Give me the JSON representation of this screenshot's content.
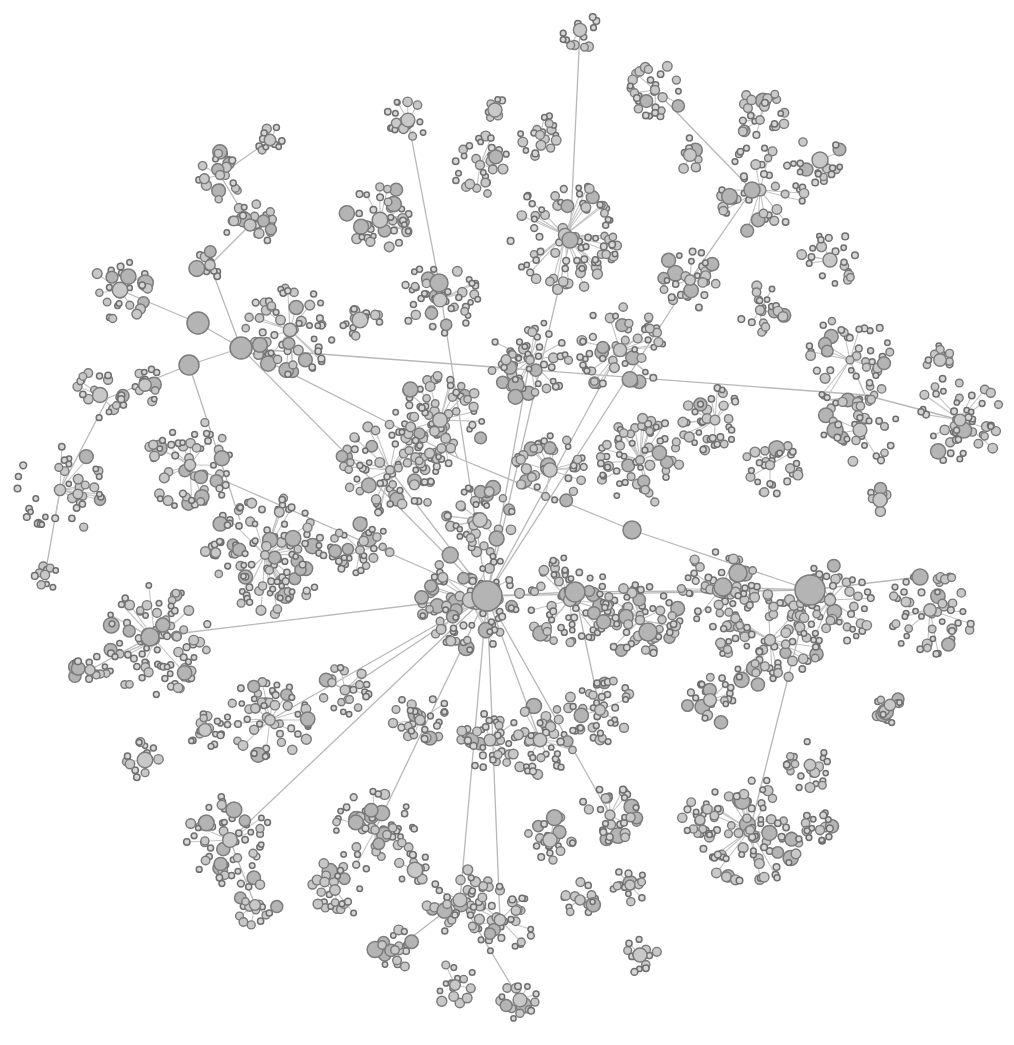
{
  "diagram": {
    "type": "force-directed network graph",
    "colors": {
      "background": "#ffffff",
      "node_fill": "#c8c8c8",
      "node_stroke": "#7a7a7a",
      "edge": "#c4c4c4"
    },
    "hubs": [
      {
        "id": "central",
        "x": 487,
        "y": 596,
        "r": 15
      },
      {
        "id": "east",
        "x": 810,
        "y": 590,
        "r": 15
      },
      {
        "id": "nw1",
        "x": 241,
        "y": 348,
        "r": 11
      },
      {
        "id": "nw2",
        "x": 198,
        "y": 323,
        "r": 11
      },
      {
        "id": "nw3",
        "x": 189,
        "y": 365,
        "r": 10
      },
      {
        "id": "n1",
        "x": 439,
        "y": 283,
        "r": 9
      },
      {
        "id": "n2",
        "x": 570,
        "y": 240,
        "r": 8
      },
      {
        "id": "ne1",
        "x": 752,
        "y": 190,
        "r": 8
      },
      {
        "id": "e1",
        "x": 575,
        "y": 592,
        "r": 10
      },
      {
        "id": "e2",
        "x": 632,
        "y": 530,
        "r": 9
      },
      {
        "id": "e3",
        "x": 648,
        "y": 632,
        "r": 9
      },
      {
        "id": "e4",
        "x": 723,
        "y": 587,
        "r": 9
      },
      {
        "id": "e5",
        "x": 738,
        "y": 573,
        "r": 9
      },
      {
        "id": "w1",
        "x": 150,
        "y": 637,
        "r": 9
      },
      {
        "id": "far-e",
        "x": 920,
        "y": 577,
        "r": 8
      }
    ],
    "clusters": [
      {
        "x": 580,
        "y": 30,
        "r": 20,
        "n": 12
      },
      {
        "x": 655,
        "y": 90,
        "r": 30,
        "n": 30
      },
      {
        "x": 760,
        "y": 120,
        "r": 30,
        "n": 25
      },
      {
        "x": 820,
        "y": 160,
        "r": 25,
        "n": 18
      },
      {
        "x": 760,
        "y": 190,
        "r": 45,
        "n": 40
      },
      {
        "x": 830,
        "y": 260,
        "r": 30,
        "n": 20
      },
      {
        "x": 690,
        "y": 155,
        "r": 18,
        "n": 10
      },
      {
        "x": 408,
        "y": 120,
        "r": 22,
        "n": 18
      },
      {
        "x": 480,
        "y": 165,
        "r": 30,
        "n": 28
      },
      {
        "x": 540,
        "y": 135,
        "r": 22,
        "n": 18
      },
      {
        "x": 565,
        "y": 235,
        "r": 55,
        "n": 80
      },
      {
        "x": 380,
        "y": 220,
        "r": 35,
        "n": 40
      },
      {
        "x": 440,
        "y": 300,
        "r": 40,
        "n": 45
      },
      {
        "x": 495,
        "y": 110,
        "r": 12,
        "n": 6
      },
      {
        "x": 270,
        "y": 140,
        "r": 15,
        "n": 10
      },
      {
        "x": 220,
        "y": 175,
        "r": 25,
        "n": 20
      },
      {
        "x": 250,
        "y": 225,
        "r": 25,
        "n": 22
      },
      {
        "x": 210,
        "y": 265,
        "r": 15,
        "n": 10
      },
      {
        "x": 290,
        "y": 330,
        "r": 45,
        "n": 60
      },
      {
        "x": 360,
        "y": 320,
        "r": 20,
        "n": 14
      },
      {
        "x": 120,
        "y": 290,
        "r": 30,
        "n": 25
      },
      {
        "x": 100,
        "y": 395,
        "r": 30,
        "n": 22
      },
      {
        "x": 145,
        "y": 385,
        "r": 18,
        "n": 12
      },
      {
        "x": 60,
        "y": 490,
        "r": 45,
        "n": 40
      },
      {
        "x": 45,
        "y": 575,
        "r": 15,
        "n": 10
      },
      {
        "x": 190,
        "y": 465,
        "r": 45,
        "n": 55
      },
      {
        "x": 265,
        "y": 555,
        "r": 60,
        "n": 110
      },
      {
        "x": 155,
        "y": 640,
        "r": 55,
        "n": 90
      },
      {
        "x": 90,
        "y": 670,
        "r": 18,
        "n": 14
      },
      {
        "x": 390,
        "y": 470,
        "r": 50,
        "n": 80
      },
      {
        "x": 440,
        "y": 420,
        "r": 45,
        "n": 65
      },
      {
        "x": 530,
        "y": 360,
        "r": 40,
        "n": 55
      },
      {
        "x": 620,
        "y": 350,
        "r": 45,
        "n": 55
      },
      {
        "x": 690,
        "y": 280,
        "r": 30,
        "n": 30
      },
      {
        "x": 760,
        "y": 310,
        "r": 25,
        "n": 20
      },
      {
        "x": 850,
        "y": 360,
        "r": 45,
        "n": 45
      },
      {
        "x": 860,
        "y": 430,
        "r": 40,
        "n": 45
      },
      {
        "x": 960,
        "y": 420,
        "r": 45,
        "n": 50
      },
      {
        "x": 715,
        "y": 420,
        "r": 35,
        "n": 35
      },
      {
        "x": 770,
        "y": 465,
        "r": 30,
        "n": 30
      },
      {
        "x": 640,
        "y": 460,
        "r": 45,
        "n": 60
      },
      {
        "x": 550,
        "y": 470,
        "r": 35,
        "n": 40
      },
      {
        "x": 480,
        "y": 520,
        "r": 35,
        "n": 40
      },
      {
        "x": 360,
        "y": 550,
        "r": 30,
        "n": 35
      },
      {
        "x": 470,
        "y": 600,
        "r": 50,
        "n": 90
      },
      {
        "x": 570,
        "y": 600,
        "r": 45,
        "n": 70
      },
      {
        "x": 640,
        "y": 620,
        "r": 40,
        "n": 55
      },
      {
        "x": 720,
        "y": 590,
        "r": 40,
        "n": 55
      },
      {
        "x": 770,
        "y": 640,
        "r": 50,
        "n": 75
      },
      {
        "x": 830,
        "y": 600,
        "r": 45,
        "n": 60
      },
      {
        "x": 930,
        "y": 610,
        "r": 45,
        "n": 50
      },
      {
        "x": 890,
        "y": 705,
        "r": 18,
        "n": 14
      },
      {
        "x": 710,
        "y": 700,
        "r": 25,
        "n": 22
      },
      {
        "x": 600,
        "y": 710,
        "r": 35,
        "n": 40
      },
      {
        "x": 540,
        "y": 740,
        "r": 35,
        "n": 45
      },
      {
        "x": 490,
        "y": 740,
        "r": 30,
        "n": 35
      },
      {
        "x": 420,
        "y": 720,
        "r": 30,
        "n": 30
      },
      {
        "x": 345,
        "y": 690,
        "r": 25,
        "n": 25
      },
      {
        "x": 270,
        "y": 720,
        "r": 45,
        "n": 55
      },
      {
        "x": 205,
        "y": 730,
        "r": 20,
        "n": 16
      },
      {
        "x": 145,
        "y": 760,
        "r": 20,
        "n": 14
      },
      {
        "x": 230,
        "y": 840,
        "r": 45,
        "n": 55
      },
      {
        "x": 255,
        "y": 905,
        "r": 22,
        "n": 16
      },
      {
        "x": 375,
        "y": 830,
        "r": 40,
        "n": 50
      },
      {
        "x": 335,
        "y": 890,
        "r": 30,
        "n": 25
      },
      {
        "x": 415,
        "y": 870,
        "r": 18,
        "n": 14
      },
      {
        "x": 460,
        "y": 900,
        "r": 35,
        "n": 35
      },
      {
        "x": 500,
        "y": 920,
        "r": 35,
        "n": 40
      },
      {
        "x": 395,
        "y": 950,
        "r": 22,
        "n": 18
      },
      {
        "x": 455,
        "y": 985,
        "r": 22,
        "n": 16
      },
      {
        "x": 520,
        "y": 1000,
        "r": 20,
        "n": 16
      },
      {
        "x": 550,
        "y": 840,
        "r": 25,
        "n": 25
      },
      {
        "x": 580,
        "y": 900,
        "r": 18,
        "n": 14
      },
      {
        "x": 610,
        "y": 815,
        "r": 30,
        "n": 30
      },
      {
        "x": 630,
        "y": 885,
        "r": 18,
        "n": 14
      },
      {
        "x": 640,
        "y": 955,
        "r": 18,
        "n": 12
      },
      {
        "x": 750,
        "y": 830,
        "r": 55,
        "n": 80
      },
      {
        "x": 810,
        "y": 765,
        "r": 25,
        "n": 22
      },
      {
        "x": 820,
        "y": 830,
        "r": 20,
        "n": 16
      },
      {
        "x": 700,
        "y": 820,
        "r": 20,
        "n": 18
      },
      {
        "x": 880,
        "y": 500,
        "r": 12,
        "n": 8
      },
      {
        "x": 940,
        "y": 360,
        "r": 15,
        "n": 10
      }
    ],
    "long_edges": [
      [
        487,
        596,
        241,
        348
      ],
      [
        487,
        596,
        439,
        283
      ],
      [
        487,
        596,
        570,
        240
      ],
      [
        487,
        596,
        810,
        590
      ],
      [
        487,
        596,
        150,
        637
      ],
      [
        487,
        596,
        230,
        840
      ],
      [
        487,
        596,
        375,
        830
      ],
      [
        487,
        596,
        460,
        900
      ],
      [
        487,
        596,
        610,
        815
      ],
      [
        487,
        596,
        540,
        740
      ],
      [
        487,
        596,
        390,
        470
      ],
      [
        487,
        596,
        530,
        360
      ],
      [
        487,
        596,
        620,
        350
      ],
      [
        487,
        596,
        690,
        280
      ],
      [
        487,
        596,
        270,
        720
      ],
      [
        487,
        596,
        200,
        470
      ],
      [
        487,
        596,
        345,
        690
      ],
      [
        487,
        596,
        575,
        592
      ],
      [
        241,
        348,
        198,
        323
      ],
      [
        241,
        348,
        189,
        365
      ],
      [
        198,
        323,
        120,
        290
      ],
      [
        189,
        365,
        108,
        398
      ],
      [
        241,
        348,
        865,
        395
      ],
      [
        241,
        348,
        458,
        458
      ],
      [
        108,
        398,
        60,
        490
      ],
      [
        189,
        365,
        240,
        520
      ],
      [
        810,
        590,
        920,
        577
      ],
      [
        810,
        590,
        632,
        530
      ],
      [
        810,
        590,
        723,
        587
      ],
      [
        632,
        530,
        458,
        458
      ],
      [
        575,
        592,
        810,
        590
      ],
      [
        752,
        190,
        690,
        280
      ],
      [
        752,
        190,
        655,
        90
      ],
      [
        570,
        240,
        580,
        30
      ],
      [
        439,
        283,
        408,
        120
      ],
      [
        439,
        283,
        440,
        300
      ],
      [
        458,
        458,
        440,
        420
      ],
      [
        865,
        395,
        960,
        420
      ],
      [
        865,
        395,
        830,
        400
      ],
      [
        865,
        395,
        850,
        360
      ],
      [
        810,
        590,
        750,
        830
      ],
      [
        487,
        596,
        500,
        920
      ],
      [
        575,
        592,
        600,
        710
      ],
      [
        230,
        840,
        255,
        905
      ],
      [
        460,
        900,
        520,
        1000
      ],
      [
        460,
        900,
        395,
        950
      ],
      [
        150,
        637,
        90,
        670
      ],
      [
        150,
        637,
        155,
        640
      ],
      [
        60,
        490,
        45,
        575
      ],
      [
        241,
        348,
        210,
        265
      ],
      [
        210,
        265,
        250,
        225
      ],
      [
        250,
        225,
        220,
        175
      ],
      [
        220,
        175,
        270,
        140
      ]
    ]
  },
  "caption": ""
}
